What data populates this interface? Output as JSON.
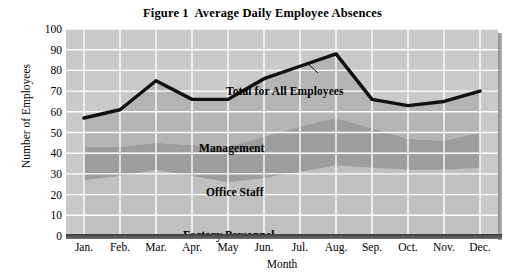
{
  "figure": {
    "title": "Figure 1  Average Daily Employee Absences"
  },
  "axes": {
    "y_title": "Number of Employees",
    "x_title": "Month",
    "y_ticks": [
      "100",
      "90",
      "80",
      "70",
      "60",
      "50",
      "40",
      "30",
      "20",
      "10",
      "0"
    ],
    "x_ticks": [
      "Jan.",
      "Feb.",
      "Mar.",
      "Apr.",
      "May",
      "Jun.",
      "Jul.",
      "Aug.",
      "Sep.",
      "Oct.",
      "Nov.",
      "Dec."
    ]
  },
  "labels": {
    "total": "Total for All Employees",
    "management": "Management",
    "office": "Office Staff",
    "factory": "Factory Personnel"
  },
  "colors": {
    "plot_background": "#c9c9c9",
    "gridline": "#ffffff",
    "factory_band": "#c0c0c0",
    "office_band": "#9d9d9d",
    "management_band": "#b4b4b4",
    "total_line": "#111111",
    "baseline": "#3a3a3a",
    "text": "#000000"
  },
  "chart_data": {
    "type": "area",
    "title": "Figure 1  Average Daily Employee Absences",
    "xlabel": "Month",
    "ylabel": "Number of Employees",
    "ylim": [
      0,
      100
    ],
    "ytick_step": 10,
    "grid": true,
    "legend": "in-plot labels",
    "stacked": true,
    "categories": [
      "Jan.",
      "Feb.",
      "Mar.",
      "Apr.",
      "May",
      "Jun.",
      "Jul.",
      "Aug.",
      "Sep.",
      "Oct.",
      "Nov.",
      "Dec."
    ],
    "series": [
      {
        "name": "Factory Personnel",
        "values": [
          27,
          29,
          32,
          29,
          26,
          28,
          31,
          34,
          33,
          32,
          32,
          33
        ]
      },
      {
        "name": "Office Staff",
        "values": [
          16,
          14,
          13,
          15,
          17,
          20,
          22,
          23,
          19,
          15,
          14,
          17
        ]
      },
      {
        "name": "Management",
        "values": [
          14,
          18,
          30,
          22,
          23,
          28,
          29,
          31,
          14,
          16,
          19,
          20
        ]
      },
      {
        "name": "Total for All Employees",
        "values": [
          57,
          61,
          75,
          66,
          66,
          76,
          82,
          88,
          66,
          63,
          65,
          70
        ]
      }
    ]
  }
}
